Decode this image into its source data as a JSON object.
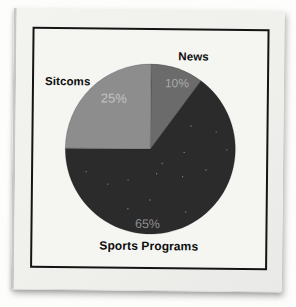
{
  "chart_data": {
    "type": "pie",
    "title": "",
    "start_angle_deg": 0,
    "direction": "clockwise",
    "legend_position": "none",
    "categories": [
      "News",
      "Sports Programs",
      "Sitcoms"
    ],
    "values": [
      10,
      65,
      25
    ],
    "slices": [
      {
        "key": "news",
        "label": "News",
        "value": 10,
        "pct_label": "10%",
        "color": "#6b6b6b",
        "pct_color": "#aaaaaa"
      },
      {
        "key": "sports",
        "label": "Sports Programs",
        "value": 65,
        "pct_label": "65%",
        "color": "#2b2b2b",
        "pct_color": "#8f8f8f"
      },
      {
        "key": "sitcoms",
        "label": "Sitcoms",
        "value": 25,
        "pct_label": "25%",
        "color": "#8d8d8d",
        "pct_color": "#c3c3c3"
      }
    ]
  },
  "frame": {
    "border_color": "#141414",
    "background": "#f5f5f2"
  },
  "card": {
    "background": "#f0f0ed"
  }
}
